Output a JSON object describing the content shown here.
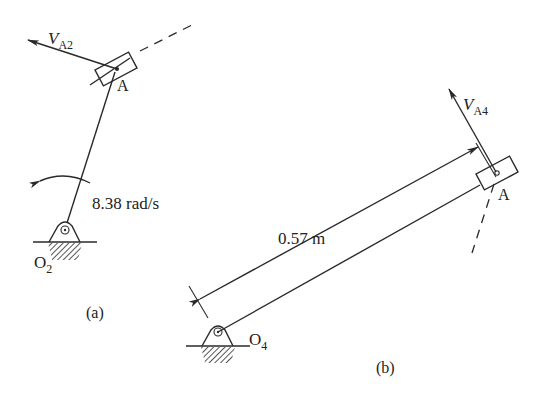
{
  "figure_a": {
    "caption": "(a)",
    "velocity_label": "V",
    "velocity_sub": "A2",
    "point_label": "A",
    "pivot_label": "O",
    "pivot_sub": "2",
    "angular_velocity": "8.38 rad/s"
  },
  "figure_b": {
    "caption": "(b)",
    "velocity_label": "V",
    "velocity_sub": "A4",
    "point_label": "A",
    "pivot_label": "O",
    "pivot_sub": "4",
    "length_label": "0.57 m"
  },
  "colors": {
    "ink": "#2a2a2a",
    "background": "#ffffff"
  }
}
